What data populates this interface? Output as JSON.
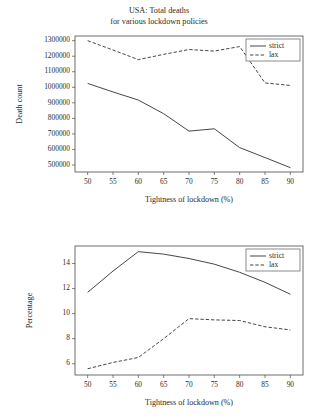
{
  "chart_data": [
    {
      "type": "line",
      "id": "total-deaths",
      "title": "USA: Total deaths\nfor various lockdown policies",
      "title_line1": "USA: Total deaths",
      "title_line2": "for various lockdown policies",
      "xlabel": "Tightness of lockdown (%)",
      "ylabel": "Death count",
      "x": [
        50,
        55,
        60,
        65,
        70,
        75,
        80,
        85,
        90
      ],
      "xticks": [
        "50",
        "55",
        "60",
        "65",
        "70",
        "75",
        "80",
        "85",
        "90"
      ],
      "yticks": [
        "500000",
        "600000",
        "700000",
        "800000",
        "900000",
        "1000000",
        "1100000",
        "1200000",
        "1300000"
      ],
      "xlim": [
        47.5,
        92.5
      ],
      "ylim": [
        455000,
        1330000
      ],
      "grid": false,
      "legend_position": "top-right",
      "series": [
        {
          "name": "strict",
          "style": "solid",
          "color": "#3c3c3c",
          "values": [
            1025000,
            970000,
            918000,
            830000,
            718000,
            733000,
            612000,
            548000,
            483000
          ]
        },
        {
          "name": "lax",
          "style": "dashed",
          "color": "#3c3c3c",
          "values": [
            1300000,
            1240000,
            1178000,
            1212000,
            1243000,
            1233000,
            1262000,
            1028000,
            1012000
          ]
        }
      ]
    },
    {
      "type": "line",
      "id": "income-loss",
      "title": "USA: Income loss\nfor various lockdown policies",
      "title_line1": "USA: Income loss",
      "title_line2": "for various lockdown policies",
      "xlabel": "Tightness of lockdown (%)",
      "ylabel": "Percentage",
      "x": [
        50,
        55,
        60,
        65,
        70,
        75,
        80,
        85,
        90
      ],
      "xticks": [
        "50",
        "55",
        "60",
        "65",
        "70",
        "75",
        "80",
        "85",
        "90"
      ],
      "yticks": [
        "6",
        "8",
        "10",
        "12",
        "14"
      ],
      "xlim": [
        47.5,
        92.5
      ],
      "ylim": [
        5.1,
        15.4
      ],
      "grid": false,
      "legend_position": "top-right",
      "series": [
        {
          "name": "strict",
          "style": "solid",
          "color": "#3c3c3c",
          "values": [
            11.7,
            13.4,
            14.95,
            14.75,
            14.4,
            13.95,
            13.3,
            12.5,
            11.55
          ]
        },
        {
          "name": "lax",
          "style": "dashed",
          "color": "#3c3c3c",
          "values": [
            5.6,
            6.1,
            6.5,
            8.0,
            9.6,
            9.5,
            9.45,
            8.95,
            8.7
          ]
        }
      ]
    }
  ]
}
